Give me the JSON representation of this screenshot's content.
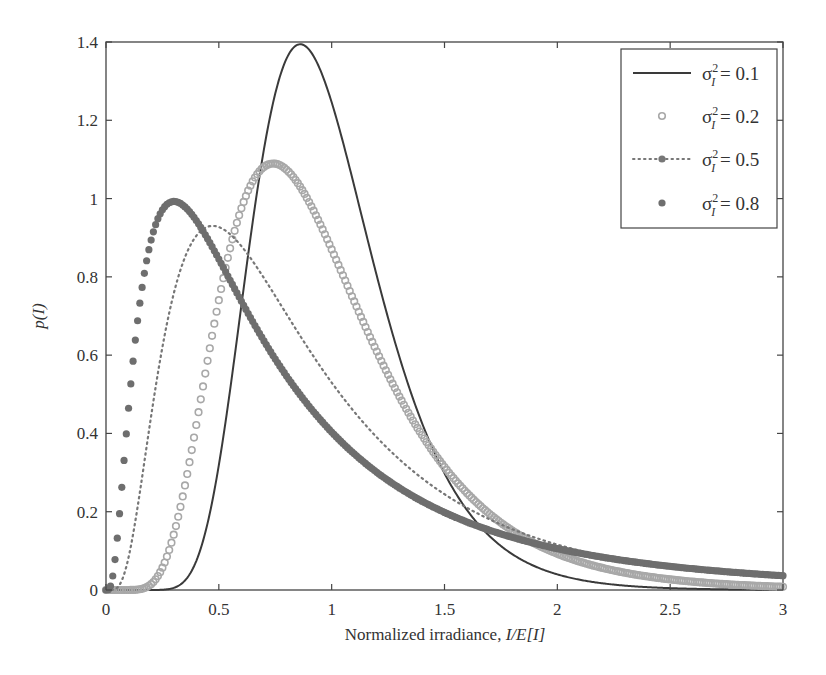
{
  "chart_data": {
    "type": "line",
    "title": "",
    "xlabel": "Normalized irradiance, I/E[I]",
    "xlabel_parts": {
      "plain": "Normalized irradiance, ",
      "italic": "I/E[I]"
    },
    "ylabel": "p(I)",
    "xlim": [
      0,
      3
    ],
    "ylim": [
      0,
      1.4
    ],
    "x_ticks": [
      0,
      0.5,
      1,
      1.5,
      2,
      2.5,
      3
    ],
    "x_tick_labels": [
      "0",
      "0.5",
      "1",
      "1.5",
      "2",
      "2.5",
      "3"
    ],
    "y_ticks": [
      0,
      0.2,
      0.4,
      0.6,
      0.8,
      1.0,
      1.2,
      1.4
    ],
    "y_tick_labels": [
      "0",
      "0.2",
      "0.4",
      "0.6",
      "0.8",
      "1",
      "1.2",
      "1.4"
    ],
    "grid": false,
    "legend_position": "upper right",
    "distribution": "lognormal, E[I] = 1",
    "series": [
      {
        "name": "σ_I² = 0.1",
        "variance": 0.1,
        "style": "solid",
        "color": "#3a3a3a",
        "peak_x": 0.86,
        "peak_y": 1.39,
        "x": [
          0,
          0.25,
          0.5,
          0.75,
          1.0,
          1.25,
          1.5,
          2.0,
          2.5,
          3.0
        ],
        "values": [
          0,
          0.0,
          0.22,
          1.23,
          1.2,
          0.54,
          0.17,
          0.01,
          0.0,
          0.0
        ]
      },
      {
        "name": "σ_I² = 0.2",
        "variance": 0.2,
        "style": "open-circles",
        "color": "#a8a8a8",
        "peak_x": 0.74,
        "peak_y": 1.09,
        "x": [
          0,
          0.25,
          0.5,
          0.75,
          1.0,
          1.25,
          1.5,
          2.0,
          2.5,
          3.0
        ],
        "values": [
          0,
          0.04,
          0.62,
          1.09,
          0.84,
          0.52,
          0.28,
          0.07,
          0.02,
          0.005
        ]
      },
      {
        "name": "σ_I² = 0.5",
        "variance": 0.5,
        "style": "dotted",
        "color": "#777777",
        "peak_x": 0.47,
        "peak_y": 0.93,
        "x": [
          0,
          0.25,
          0.5,
          0.75,
          1.0,
          1.25,
          1.5,
          2.0,
          2.5,
          3.0
        ],
        "values": [
          0,
          0.64,
          0.93,
          0.78,
          0.53,
          0.35,
          0.22,
          0.09,
          0.04,
          0.02
        ]
      },
      {
        "name": "σ_I² = 0.8",
        "variance": 0.8,
        "style": "filled-circles",
        "color": "#6e6e6e",
        "peak_x": 0.3,
        "peak_y": 0.98,
        "x": [
          0,
          0.25,
          0.5,
          0.75,
          1.0,
          1.25,
          1.5,
          2.0,
          2.5,
          3.0
        ],
        "values": [
          0,
          0.97,
          0.82,
          0.57,
          0.4,
          0.28,
          0.2,
          0.11,
          0.06,
          0.03
        ]
      }
    ]
  },
  "legend": {
    "items": [
      {
        "label_prefix": "σ",
        "sup": "2",
        "sub": "I",
        "label_suffix": " = 0.1"
      },
      {
        "label_prefix": "σ",
        "sup": "2",
        "sub": "I",
        "label_suffix": " = 0.2"
      },
      {
        "label_prefix": "σ",
        "sup": "2",
        "sub": "I",
        "label_suffix": " = 0.5"
      },
      {
        "label_prefix": "σ",
        "sup": "2",
        "sub": "I",
        "label_suffix": " = 0.8"
      }
    ]
  }
}
